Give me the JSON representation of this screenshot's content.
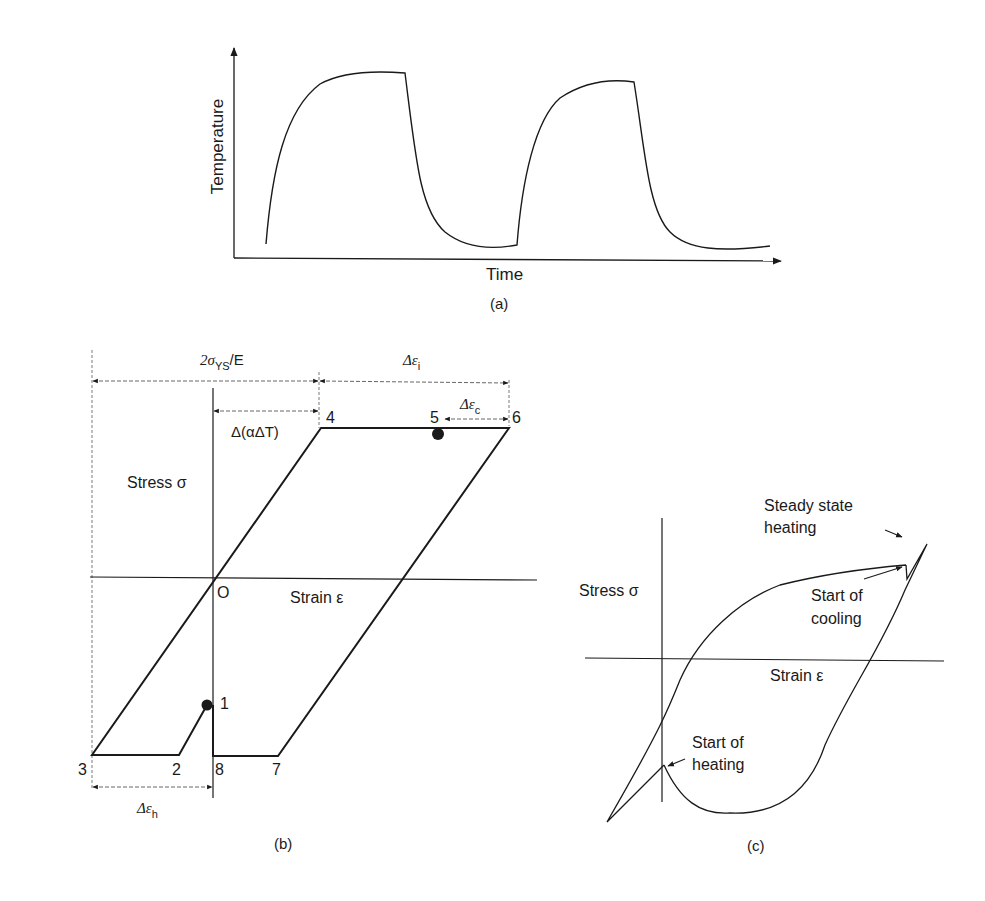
{
  "panel_a": {
    "caption": "(a)",
    "x_label": "Time",
    "y_label": "Temperature"
  },
  "panel_b": {
    "caption": "(b)",
    "y_label": "Stress σ",
    "x_label": "Strain ε",
    "origin_label": "O",
    "dim_2sigma": {
      "main": "2σ",
      "sub": "YS",
      "tail": "/E"
    },
    "dim_delta_eps_i": {
      "main": "Δε",
      "sub": "i"
    },
    "dim_delta_eps_c": {
      "main": "Δε",
      "sub": "c"
    },
    "dim_delta_eps_h": {
      "main": "Δε",
      "sub": "h"
    },
    "dim_alpha": "Δ(αΔT)",
    "points": [
      "1",
      "2",
      "3",
      "4",
      "5",
      "6",
      "7",
      "8"
    ]
  },
  "panel_c": {
    "caption": "(c)",
    "y_label": "Stress σ",
    "x_label": "Strain ε",
    "annotations": {
      "steady_line1": "Steady state",
      "steady_line2": "heating",
      "cooling_line1": "Start of",
      "cooling_line2": "cooling",
      "heating_line1": "Start of",
      "heating_line2": "heating"
    }
  },
  "colors": {
    "ink": "#1a1a1a",
    "background": "#ffffff"
  }
}
